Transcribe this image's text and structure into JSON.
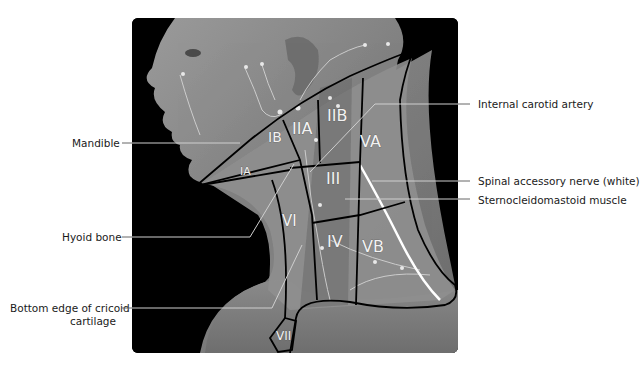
{
  "figure": {
    "labels_left": [
      {
        "id": "mandible",
        "text": "Mandible"
      },
      {
        "id": "hyoid",
        "text": "Hyoid bone"
      },
      {
        "id": "cricoid",
        "text_line1": "Bottom edge of cricoid",
        "text_line2": "cartilage"
      }
    ],
    "labels_right": [
      {
        "id": "internal-carotid",
        "text": "Internal carotid artery"
      },
      {
        "id": "spinal-accessory",
        "text": "Spinal accessory nerve (white)"
      },
      {
        "id": "sternocleidomastoid",
        "text": "Sternocleidomastoid muscle"
      }
    ],
    "levels": [
      {
        "id": "IA",
        "text": "IA"
      },
      {
        "id": "IB",
        "text": "IB"
      },
      {
        "id": "IIA",
        "text": "IIA"
      },
      {
        "id": "IIB",
        "text": "IIB"
      },
      {
        "id": "III",
        "text": "III"
      },
      {
        "id": "IV",
        "text": "IV"
      },
      {
        "id": "VA",
        "text": "VA"
      },
      {
        "id": "VB",
        "text": "VB"
      },
      {
        "id": "VI",
        "text": "VI"
      },
      {
        "id": "VII",
        "text": "VII"
      }
    ],
    "colors": {
      "background": "#000000",
      "skin": "#8c8c8c",
      "outline": "#000000",
      "leader": "#c8c8c8",
      "leader_outside": "#555555",
      "nerve": "#ffffff"
    }
  }
}
